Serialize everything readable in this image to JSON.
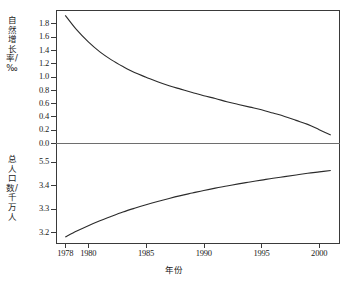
{
  "chart_data": {
    "type": "line",
    "title": "",
    "xlabel": "年份",
    "panels": [
      {
        "name": "natural-growth-rate",
        "ylabel": "自然增长率/‰",
        "ylabel_chars": "自然增长率/‰",
        "ylim": [
          0.0,
          2.0
        ],
        "yticks": [
          "0.0",
          "0.2",
          "0.4",
          "0.6",
          "0.8",
          "1.0",
          "1.2",
          "1.4",
          "1.6",
          "1.8"
        ],
        "ytick_values": [
          0.0,
          0.2,
          0.4,
          0.6,
          0.8,
          1.0,
          1.2,
          1.4,
          1.6,
          1.8
        ],
        "x": [
          1978,
          1979,
          1980,
          1981,
          1982,
          1983,
          1984,
          1985,
          1986,
          1987,
          1988,
          1989,
          1990,
          1991,
          1992,
          1993,
          1994,
          1995,
          1996,
          1997,
          1998,
          1999,
          2000,
          2001
        ],
        "values": [
          1.92,
          1.7,
          1.52,
          1.37,
          1.25,
          1.15,
          1.06,
          0.99,
          0.92,
          0.86,
          0.81,
          0.76,
          0.71,
          0.67,
          0.62,
          0.58,
          0.54,
          0.5,
          0.45,
          0.4,
          0.34,
          0.28,
          0.2,
          0.12
        ]
      },
      {
        "name": "total-population",
        "ylabel": "总人口数/千万人",
        "ylabel_chars": "总人口数/千万人",
        "ylim": [
          3.15,
          3.58
        ],
        "yticks": [
          "3.2",
          "3.3",
          "3.4",
          "5.5"
        ],
        "ytick_values": [
          3.2,
          3.3,
          3.4,
          3.5
        ],
        "x": [
          1978,
          1979,
          1980,
          1981,
          1982,
          1983,
          1984,
          1985,
          1986,
          1987,
          1988,
          1989,
          1990,
          1991,
          1992,
          1993,
          1994,
          1995,
          1996,
          1997,
          1998,
          1999,
          2000,
          2001
        ],
        "values": [
          3.18,
          3.205,
          3.228,
          3.249,
          3.268,
          3.286,
          3.302,
          3.317,
          3.331,
          3.344,
          3.356,
          3.367,
          3.378,
          3.388,
          3.397,
          3.406,
          3.414,
          3.422,
          3.43,
          3.437,
          3.444,
          3.451,
          3.457,
          3.463
        ]
      }
    ],
    "xticks": [
      "1978",
      "1980",
      "1985",
      "1990",
      "1995",
      "2000"
    ],
    "xtick_values": [
      1978,
      1980,
      1985,
      1990,
      1995,
      2000
    ],
    "xlim": [
      1977.2,
      2001.8
    ],
    "grid": false,
    "legend": null,
    "line_color": "#2b2b2b"
  }
}
